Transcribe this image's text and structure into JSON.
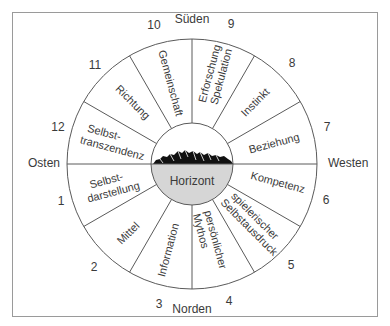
{
  "diagram": {
    "center_label": "Horizont",
    "directions": {
      "north": "Norden",
      "south": "Süden",
      "east": "Osten",
      "west": "Westen"
    },
    "segments": [
      {
        "number": "1",
        "label_lines": [
          "Selbst-",
          "darstellung"
        ]
      },
      {
        "number": "2",
        "label_lines": [
          "Mittel"
        ]
      },
      {
        "number": "3",
        "label_lines": [
          "Information"
        ]
      },
      {
        "number": "4",
        "label_lines": [
          "persönlicher",
          "Mythos"
        ]
      },
      {
        "number": "5",
        "label_lines": [
          "spielerischer",
          "Selbstausdruck"
        ]
      },
      {
        "number": "6",
        "label_lines": [
          "Kompetenz"
        ]
      },
      {
        "number": "7",
        "label_lines": [
          "Beziehung"
        ]
      },
      {
        "number": "8",
        "label_lines": [
          "Instinkt"
        ]
      },
      {
        "number": "9",
        "label_lines": [
          "Erforschung",
          "Spekulation"
        ]
      },
      {
        "number": "10",
        "label_lines": [
          "Gemeinschaft"
        ]
      },
      {
        "number": "11",
        "label_lines": [
          "Richtung"
        ]
      },
      {
        "number": "12",
        "label_lines": [
          "Selbst-",
          "transzendenz"
        ]
      }
    ],
    "colors": {
      "line": "#5a5a5a",
      "text": "#3a3a3a",
      "horizon_fill": "#d6d6d6",
      "frame": "#9a9a9a"
    }
  }
}
